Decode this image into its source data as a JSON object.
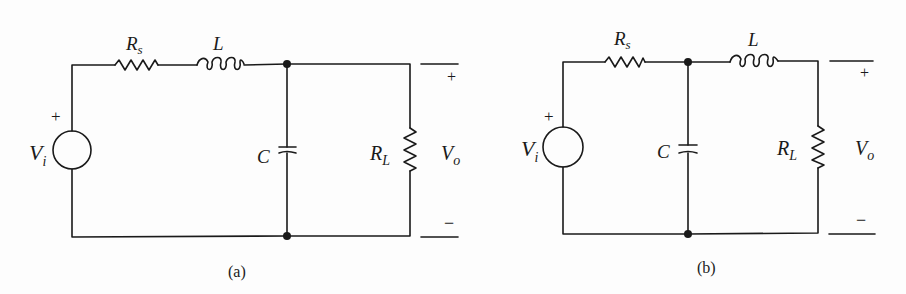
{
  "circuits": [
    {
      "id": "a",
      "caption": "(a)",
      "topology": "Vi - Rs - L (series) - node - C shunt || RL",
      "labels": {
        "source": "V",
        "source_sub": "i",
        "source_plus": "+",
        "rs": "R",
        "rs_sub": "s",
        "inductor": "L",
        "capacitor": "C",
        "load": "R",
        "load_sub": "L",
        "out": "V",
        "out_sub": "o",
        "out_plus": "+",
        "out_minus": "−"
      }
    },
    {
      "id": "b",
      "caption": "(b)",
      "topology": "Vi - Rs - node - C shunt - L (series) - RL",
      "labels": {
        "source": "V",
        "source_sub": "i",
        "source_plus": "+",
        "rs": "R",
        "rs_sub": "s",
        "inductor": "L",
        "capacitor": "C",
        "load": "R",
        "load_sub": "L",
        "out": "V",
        "out_sub": "o",
        "out_plus": "+",
        "out_minus": "−"
      }
    }
  ],
  "colors": {
    "ink": "#1a1a1a",
    "paper": "#fdfdfd"
  }
}
